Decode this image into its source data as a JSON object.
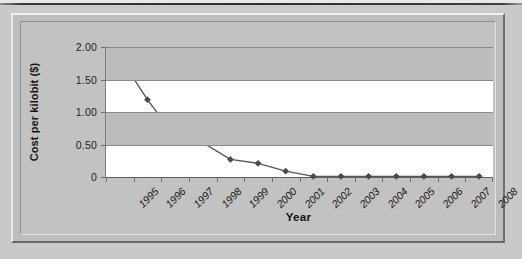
{
  "chart_data": {
    "type": "line",
    "title": "",
    "xlabel": "Year",
    "ylabel": "Cost per kilobit ($)",
    "categories": [
      "1995",
      "1996",
      "1997",
      "1998",
      "1999",
      "2000",
      "2001",
      "2002",
      "2003",
      "2004",
      "2005",
      "2006",
      "2007",
      "2008"
    ],
    "values": [
      1.84,
      1.19,
      0.62,
      0.53,
      0.27,
      0.21,
      0.09,
      0.01,
      0.01,
      0.01,
      0.01,
      0.01,
      0.01,
      0.01
    ],
    "series": [
      {
        "name": "Cost per kilobit ($)",
        "values": [
          1.84,
          1.19,
          0.62,
          0.53,
          0.27,
          0.21,
          0.09,
          0.01,
          0.01,
          0.01,
          0.01,
          0.01,
          0.01,
          0.01
        ]
      }
    ],
    "ylim": [
      0,
      2.0
    ],
    "ytick_labels": [
      "2.00",
      "1.50",
      "1.00",
      "0.50",
      "0"
    ],
    "ytick_values": [
      2.0,
      1.5,
      1.0,
      0.5,
      0
    ],
    "grid": true,
    "legend": false,
    "legend_position": "none",
    "marker": "diamond",
    "line_color": "#595959",
    "marker_color": "#4a4a4a",
    "band_color": "#bcbcbc",
    "plot_background": "#ffffff",
    "frame_background": "#c2c2c2"
  },
  "axes": {
    "y_title": "Cost per kilobit ($)",
    "x_title": "Year"
  }
}
